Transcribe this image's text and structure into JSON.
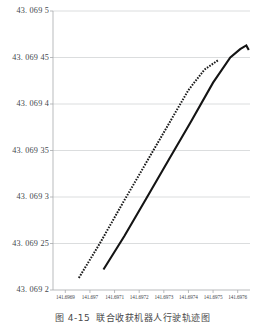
{
  "caption": {
    "number": "图 4-15",
    "text": "联合收获机器人行驶轨迹图"
  },
  "chart_data": {
    "type": "line",
    "title": "",
    "xlabel": "",
    "ylabel": "",
    "grid": true,
    "legend": "none",
    "xlim": [
      141.69685,
      141.69765
    ],
    "ylim": [
      43.0692,
      43.0695
    ],
    "xticks": [
      "141.6969",
      "141.697",
      "141.6971",
      "141.6972",
      "141.6973",
      "141.6974",
      "141.6975",
      "141.6976"
    ],
    "xtick_values": [
      141.6969,
      141.697,
      141.6971,
      141.6972,
      141.6973,
      141.6974,
      141.6975,
      141.6976
    ],
    "yticks": [
      "43. 069 2",
      "43. 069 25",
      "43. 069 3",
      "43. 069 35",
      "43. 069 4",
      "43. 069 45",
      "43. 069 5"
    ],
    "ytick_values": [
      43.0692,
      43.06925,
      43.0693,
      43.06935,
      43.0694,
      43.06945,
      43.0695
    ],
    "series": [
      {
        "name": "desired-path",
        "style": "dotted",
        "color": "#1a1a1a",
        "x": [
          141.696955,
          141.69704,
          141.69713,
          141.69722,
          141.69731,
          141.6974,
          141.697465,
          141.69752
        ],
        "y": [
          43.069213,
          43.06925,
          43.069292,
          43.069333,
          43.069374,
          43.069415,
          43.069437,
          43.069447
        ]
      },
      {
        "name": "actual-path",
        "style": "solid",
        "color": "#141414",
        "x": [
          141.697055,
          141.69714,
          141.69723,
          141.69732,
          141.69741,
          141.6975,
          141.69757,
          141.69761,
          141.697635,
          141.697645
        ],
        "y": [
          43.069222,
          43.069258,
          43.069299,
          43.06934,
          43.069381,
          43.069423,
          43.06945,
          43.069459,
          43.069463,
          43.069458
        ]
      }
    ]
  },
  "axis_style": {
    "gridline_color": "#d2d4d6",
    "axis_color": "#a7a9ac",
    "tick_color": "#a7a9ac"
  }
}
